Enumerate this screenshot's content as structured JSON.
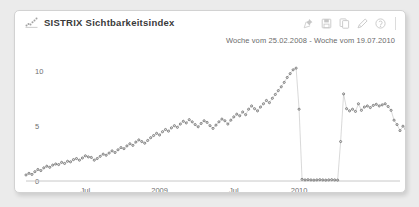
{
  "header": {
    "title": "SISTRIX Sichtbarkeitsindex",
    "title_icon": "scatter-chart-icon",
    "subtitle": "Woche vom 25.02.2008 - Woche vom 19.07.2010",
    "tools": [
      {
        "name": "pin-icon",
        "label": "Pin"
      },
      {
        "name": "save-icon",
        "label": "Speichern"
      },
      {
        "name": "copy-icon",
        "label": "Kopieren"
      },
      {
        "name": "edit-icon",
        "label": "Bearbeiten"
      },
      {
        "name": "help-icon",
        "label": "Hilfe"
      }
    ]
  },
  "colors": {
    "card_background": "#ffffff",
    "page_background": "#ebebeb",
    "card_border": "#d2d2d2",
    "title_text": "#3a3a3a",
    "axis_text": "#6f6f6f",
    "series_marker": "#6e6e6e",
    "series_line": "#b9b9b9",
    "axis_line": "#c8c8c8"
  },
  "chart_data": {
    "type": "scatter",
    "title": "SISTRIX Sichtbarkeitsindex",
    "subtitle": "Woche vom 25.02.2008 - Woche vom 19.07.2010",
    "xlabel": "",
    "ylabel": "",
    "ylim": [
      0,
      11.5
    ],
    "yticks": [
      0,
      5,
      10
    ],
    "ytick_labels": [
      "0",
      "5",
      "10"
    ],
    "xticks": [
      20,
      45,
      70,
      92
    ],
    "xtick_labels": [
      "Jul",
      "2009",
      "Jul",
      "2010"
    ],
    "grid": false,
    "legend": "none",
    "xlim": [
      0,
      127
    ],
    "x_note": "index = weeks since 25.02.2008; 127 weekly samples through 19.07.2010",
    "series": [
      {
        "name": "Sichtbarkeitsindex",
        "marker": "circle-open",
        "values": [
          0.55,
          0.7,
          0.6,
          0.85,
          1.05,
          0.95,
          1.2,
          1.35,
          1.25,
          1.45,
          1.55,
          1.5,
          1.7,
          1.6,
          1.8,
          1.75,
          1.95,
          2.05,
          1.9,
          2.1,
          2.3,
          2.2,
          2.15,
          1.9,
          2.05,
          2.25,
          2.45,
          2.35,
          2.55,
          2.75,
          2.6,
          2.85,
          3.05,
          2.95,
          3.2,
          3.4,
          3.25,
          3.55,
          3.75,
          3.6,
          3.45,
          3.7,
          3.95,
          4.15,
          4.35,
          4.2,
          4.5,
          4.7,
          4.55,
          4.85,
          5.05,
          4.9,
          5.2,
          5.45,
          5.3,
          5.6,
          5.4,
          5.15,
          4.95,
          5.25,
          5.5,
          5.35,
          5.05,
          4.8,
          5.1,
          5.4,
          5.65,
          5.5,
          5.2,
          5.55,
          5.85,
          6.1,
          5.95,
          6.3,
          6.05,
          6.55,
          6.85,
          6.6,
          6.4,
          6.75,
          7.05,
          7.35,
          7.15,
          7.55,
          7.9,
          8.25,
          8.6,
          9.0,
          9.45,
          9.8,
          10.15,
          10.3,
          6.55,
          0.15,
          0.1,
          0.12,
          0.1,
          0.08,
          0.1,
          0.12,
          0.1,
          0.08,
          0.1,
          0.12,
          0.1,
          0.08,
          3.6,
          7.95,
          6.6,
          6.4,
          6.55,
          6.35,
          7.05,
          6.45,
          6.75,
          6.85,
          6.7,
          6.9,
          7.0,
          6.85,
          6.95,
          7.05,
          6.8,
          6.45,
          5.55,
          5.15,
          4.6,
          5.0,
          4.75,
          4.45,
          5.05,
          5.35,
          5.6,
          5.45,
          5.9,
          6.3,
          6.15,
          6.7,
          6.55,
          7.25,
          8.05,
          7.7,
          9.85,
          9.3,
          9.95,
          8.55
        ]
      }
    ]
  }
}
